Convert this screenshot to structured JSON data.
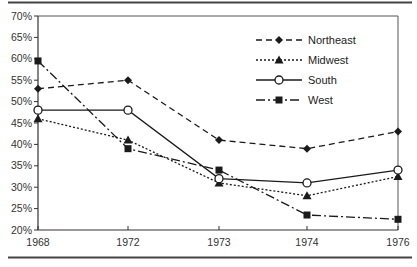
{
  "chart_data": {
    "type": "line",
    "title": "",
    "xlabel": "",
    "ylabel": "",
    "categories": [
      "1968",
      "1972",
      "1973",
      "1974",
      "1976"
    ],
    "ylim": [
      20,
      70
    ],
    "yticks": [
      "70%",
      "65%",
      "60%",
      "55%",
      "50%",
      "45%",
      "40%",
      "35%",
      "30%",
      "25%",
      "20%"
    ],
    "ytick_values": [
      70,
      65,
      60,
      55,
      50,
      45,
      40,
      35,
      30,
      25,
      20
    ],
    "grid": false,
    "legend_position": "upper right inside plot",
    "series": [
      {
        "name": "Northeast",
        "line_style": "dashed",
        "marker": "diamond",
        "values": [
          53,
          55,
          41,
          39,
          43
        ]
      },
      {
        "name": "Midwest",
        "line_style": "dotted",
        "marker": "triangle",
        "values": [
          46,
          41,
          31,
          28,
          32.5
        ]
      },
      {
        "name": "South",
        "line_style": "solid",
        "marker": "open-circle",
        "values": [
          48,
          48,
          32,
          31,
          34
        ]
      },
      {
        "name": "West",
        "line_style": "dash-dot",
        "marker": "square",
        "values": [
          59.5,
          39,
          34,
          23.5,
          22.5
        ]
      }
    ]
  },
  "colors": {
    "line": "#1a1a1a",
    "axis": "#333333",
    "rule": "#444444",
    "background": "#ffffff"
  }
}
